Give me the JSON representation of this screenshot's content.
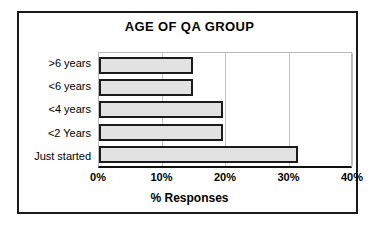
{
  "chart_data": {
    "type": "bar",
    "orientation": "horizontal",
    "title": "AGE OF QA GROUP",
    "xlabel": "% Responses",
    "ylabel": "",
    "categories": [
      "Just started",
      "<2 Years",
      "<4 years",
      "<6 years",
      ">6 years"
    ],
    "values": [
      31.3,
      19.5,
      19.5,
      14.8,
      14.8
    ],
    "display_order_top_to_bottom": [
      ">6 years",
      "<6 years",
      "<4 years",
      "<2 Years",
      "Just started"
    ],
    "xlim": [
      0,
      40
    ],
    "ylim": null,
    "xticks": [
      0,
      10,
      20,
      30,
      40
    ],
    "xtick_labels": [
      "0%",
      "10%",
      "20%",
      "30%",
      "40%"
    ],
    "grid": "vertical",
    "legend": "none",
    "bar_fill_color": "#e2e2e2",
    "bar_border_color": "#1b1b1b",
    "frame_color": "#1a1a1a",
    "gridline_color": "#c0c0c0",
    "axis_color": "#111111",
    "background_color": "#ffffff",
    "series": [
      {
        "name": "% Responses",
        "points": [
          {
            "category": ">6 years",
            "value": 14.8
          },
          {
            "category": "<6 years",
            "value": 14.8
          },
          {
            "category": "<4 years",
            "value": 19.5
          },
          {
            "category": "<2 Years",
            "value": 19.5
          },
          {
            "category": "Just started",
            "value": 31.3
          }
        ]
      }
    ]
  }
}
